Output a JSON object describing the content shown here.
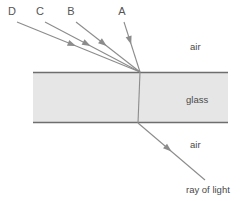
{
  "diagram": {
    "canvas": {
      "width": 243,
      "height": 201,
      "background": "#ffffff"
    },
    "colors": {
      "glass_fill": "#e6e6e6",
      "boundary_line": "#6e6e6e",
      "ray_line": "#8c8c8c",
      "label_text": "#555555",
      "medium_text": "#4a4a4a"
    },
    "slab": {
      "name": "glass",
      "label": "glass",
      "label_x": 186,
      "label_y": 103,
      "left": 33,
      "right": 228,
      "top": 72,
      "bottom": 123
    },
    "media": [
      {
        "id": "air-top",
        "label": "air",
        "x": 190,
        "y": 50
      },
      {
        "id": "air-bottom",
        "label": "air",
        "x": 190,
        "y": 148
      }
    ],
    "incidence_point": {
      "x": 140,
      "y": 72
    },
    "exit_point_bottom": {
      "x": 138,
      "y": 123
    },
    "candidate_rays": [
      {
        "id": "D",
        "label": "D",
        "label_x": 12,
        "label_y": 15,
        "x1": 140,
        "y1": 72,
        "x2": 17,
        "y2": 22,
        "arrow_t": 0.52
      },
      {
        "id": "C",
        "label": "C",
        "label_x": 40,
        "label_y": 15,
        "x1": 140,
        "y1": 72,
        "x2": 45,
        "y2": 22,
        "arrow_t": 0.52
      },
      {
        "id": "B",
        "label": "B",
        "label_x": 71,
        "label_y": 15,
        "x1": 140,
        "y1": 72,
        "x2": 76,
        "y2": 22,
        "arrow_t": 0.52
      },
      {
        "id": "A",
        "label": "A",
        "label_x": 122,
        "label_y": 15,
        "x1": 140,
        "y1": 72,
        "x2": 124,
        "y2": 22,
        "arrow_t": 0.55
      }
    ],
    "incident_ray": {
      "id": "ray-of-light",
      "label": "ray of light",
      "label_x": 186,
      "label_y": 193,
      "x1": 205,
      "y1": 180,
      "x2": 138,
      "y2": 123,
      "arrow_t": 0.5
    },
    "internal_ray": {
      "id": "ray-inside-glass",
      "x1": 138,
      "y1": 123,
      "x2": 140,
      "y2": 72
    }
  }
}
